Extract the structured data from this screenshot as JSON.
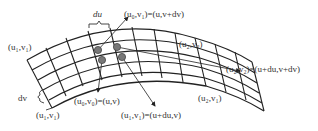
{
  "diagram": {
    "title": "",
    "type": "parametric surface grid",
    "labels": {
      "du": "du",
      "dv": "dv",
      "top_left_corner": "(u₁,v₁)",
      "bottom_left_corner": "(u₁,v₁)",
      "top_right_corner": "(u₂,v₂)",
      "bottom_right_corner": "(u₂,v₁)",
      "node_top": "(u₀,v₁)=(u,v+dv)",
      "node_origin": "(u₀,v₀)=(u,v)",
      "node_u_step": "(u₁,v₁)=(u+du,v)",
      "node_diagonal": "(u₂,v₂)=(u+du,v+dv)"
    },
    "colors": {
      "line": "#222222",
      "node_fill": "#777777",
      "node_stroke": "#444444",
      "text": "#333333",
      "background": "#ffffff"
    },
    "highlighted_nodes": 4
  }
}
